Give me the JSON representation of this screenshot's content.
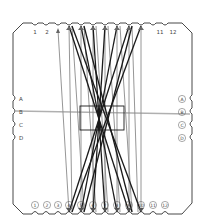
{
  "diagram": {
    "type": "string-loom-card",
    "colors": {
      "background": "#ffffff",
      "outline": "#333333",
      "string_dark": "#1a1a1a",
      "string_gray": "#8a8a8a",
      "guide_line": "#b0b0b0",
      "label": "#444444"
    },
    "top_labels": [
      "1",
      "2",
      "",
      "",
      "",
      "",
      "",
      "",
      "",
      "",
      "11",
      "12"
    ],
    "bottom_labels": [
      "1",
      "2",
      "3",
      "4",
      "5",
      "6",
      "7",
      "8",
      "9",
      "10",
      "11",
      "12"
    ],
    "left_labels": [
      "A",
      "B",
      "C",
      "D"
    ],
    "right_labels": [
      "A",
      "B",
      "C",
      "D"
    ],
    "guide_line": {
      "from": "left-B",
      "to": "right-B"
    },
    "center_box": {
      "label": ""
    }
  }
}
